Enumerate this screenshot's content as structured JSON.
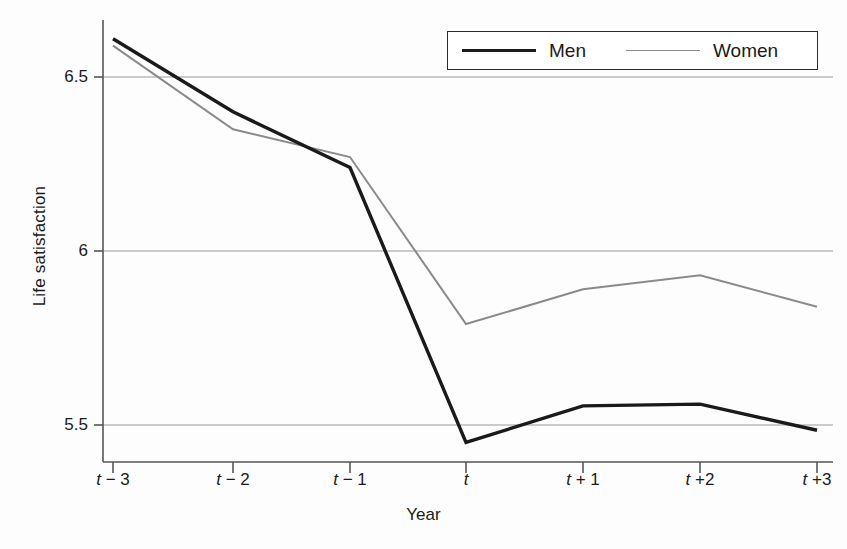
{
  "chart_data": {
    "type": "line",
    "title": "",
    "xlabel": "Year",
    "ylabel": "Life satisfaction",
    "categories": [
      "t − 3",
      "t − 2",
      "t − 1",
      "t",
      "t + 1",
      "t +2",
      "t +3"
    ],
    "x": [
      -3,
      -2,
      -1,
      0,
      1,
      2,
      3
    ],
    "ylim": [
      5.38,
      6.68
    ],
    "yticks": [
      6.5,
      6,
      5.5
    ],
    "ytick_labels": [
      "6.5",
      "6",
      "5.5"
    ],
    "grid": "horizontal",
    "legend_position": "top-right",
    "series": [
      {
        "name": "Men",
        "color": "#1a1a1a",
        "width": 3.4,
        "values": [
          6.61,
          6.4,
          6.24,
          5.45,
          5.555,
          5.56,
          5.485
        ]
      },
      {
        "name": "Women",
        "color": "#8a8a8a",
        "width": 2.0,
        "values": [
          6.59,
          6.35,
          6.27,
          5.79,
          5.89,
          5.93,
          5.84
        ]
      }
    ]
  },
  "axes": {
    "y_title": "Life satisfaction",
    "x_title": "Year",
    "axis_color": "#555555",
    "grid_color": "#9a9a9a"
  },
  "legend": {
    "items": [
      {
        "label": "Men",
        "marker": "thick-black-line"
      },
      {
        "label": "Women",
        "marker": "thin-gray-line"
      }
    ]
  }
}
